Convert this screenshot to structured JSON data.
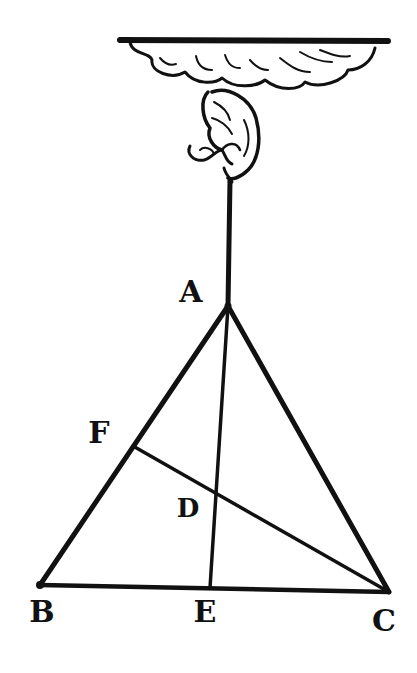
{
  "figure": {
    "kind": "woodcut geometry diagram",
    "colors": {
      "ink": "#111111",
      "paper": "#ffffff"
    }
  },
  "points": {
    "A": {
      "label": "A",
      "x": 228,
      "y": 306,
      "label_x": 191,
      "label_y": 292
    },
    "B": {
      "label": "B",
      "x": 40,
      "y": 585,
      "label_x": 42,
      "label_y": 612
    },
    "C": {
      "label": "C",
      "x": 389,
      "y": 592,
      "label_x": 384,
      "label_y": 621
    },
    "D": {
      "label": "D",
      "x": 217,
      "y": 495,
      "label_x": 188,
      "label_y": 508
    },
    "E": {
      "label": "E",
      "x": 210,
      "y": 588,
      "label_x": 205,
      "label_y": 612
    },
    "F": {
      "label": "F",
      "x": 133,
      "y": 446,
      "label_x": 99,
      "label_y": 433
    }
  },
  "segments": [
    {
      "from": "A",
      "to": "B"
    },
    {
      "from": "A",
      "to": "C"
    },
    {
      "from": "B",
      "to": "C"
    },
    {
      "from": "A",
      "to": "E"
    },
    {
      "from": "F",
      "to": "C"
    }
  ],
  "suspension": {
    "ceiling": "cloud-with-bar",
    "holder": "hand",
    "string_top_y": 182
  }
}
